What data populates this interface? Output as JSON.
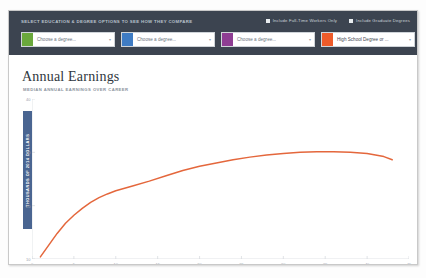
{
  "controls": {
    "title": "SELECT EDUCATION & DEGREE OPTIONS TO SEE HOW THEY COMPARE",
    "checkboxes": [
      {
        "label": "Include Full-Time Workers Only",
        "checked": true
      },
      {
        "label": "Include Graduate Degrees",
        "checked": true
      }
    ],
    "dropdowns": [
      {
        "value": "Choose a degree...",
        "swatch": "#6aa83c",
        "filled": false,
        "caret": "▾"
      },
      {
        "value": "Choose a degree...",
        "swatch": "#3f7cc4",
        "filled": false,
        "caret": "▾"
      },
      {
        "value": "Choose a degree...",
        "swatch": "#8e3d93",
        "filled": false,
        "caret": "▾"
      },
      {
        "value": "High School Degree or ...",
        "swatch": "#ee5b2a",
        "filled": true,
        "caret": "▾"
      }
    ]
  },
  "chart_data": {
    "type": "line",
    "title": "Annual Earnings",
    "subtitle": "MEDIAN ANNUAL EARNINGS OVER CAREER",
    "xlabel": "YEARS SINCE START OF CAREER",
    "ylabel": "THOUSANDS OF 2014 DOLLARS",
    "xlim": [
      0,
      45
    ],
    "ylim": [
      10,
      40
    ],
    "xticks": [
      0,
      5,
      10,
      15,
      20,
      25,
      30,
      35,
      40,
      45
    ],
    "yticks": [
      10,
      20,
      30,
      40
    ],
    "grid": false,
    "legend": "none",
    "series": [
      {
        "name": "High School Degree or ...",
        "color": "#e4673c",
        "x": [
          1,
          2,
          3,
          4,
          5,
          6,
          7,
          8,
          9,
          10,
          12,
          14,
          16,
          18,
          20,
          22,
          24,
          26,
          28,
          30,
          32,
          34,
          36,
          38,
          40,
          42,
          43
        ],
        "values": [
          10.4,
          12.6,
          14.8,
          16.7,
          18.2,
          19.5,
          20.6,
          21.5,
          22.2,
          22.8,
          23.7,
          24.6,
          25.6,
          26.6,
          27.4,
          28.0,
          28.6,
          29.1,
          29.5,
          29.8,
          30.0,
          30.1,
          30.1,
          30.0,
          29.8,
          29.2,
          28.6
        ]
      }
    ]
  }
}
